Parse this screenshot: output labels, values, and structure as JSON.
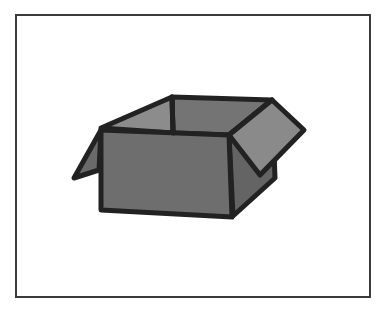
{
  "image": {
    "subject": "open cardboard box",
    "alt_text": "Illustration of an open cardboard box"
  },
  "colors": {
    "frame_border": "#3a3a3a",
    "background": "#ffffff",
    "outline": "#222222",
    "front_face": "#6e6e6e",
    "side_face": "#646464",
    "interior_back": "#747474",
    "interior_left": "#8c8c8c",
    "flap_right": "#8a8a8a",
    "flap_left": "#6a6a6a"
  }
}
